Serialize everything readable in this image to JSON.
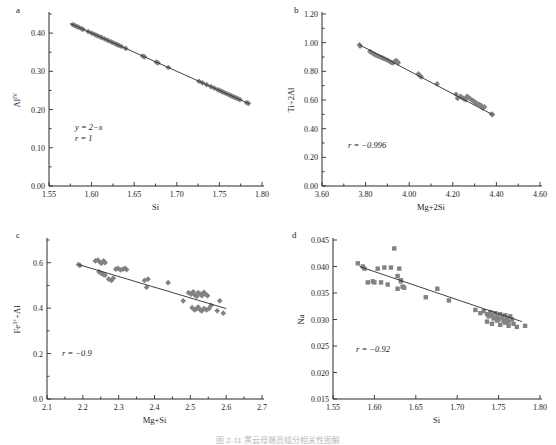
{
  "figure": {
    "caption_partial": "图 2-11  黑云母端员组分相关性图解"
  },
  "chart_data": [
    {
      "type": "scatter",
      "panel": "a",
      "panel_label": "a",
      "title": "",
      "xlabel": "Si",
      "ylabel": "Alᴵᵛ",
      "ylabel_base": "Al",
      "ylabel_sup": "IV",
      "xlim": [
        1.55,
        1.8
      ],
      "ylim": [
        0.0,
        0.45
      ],
      "xticks": [
        "1.55",
        "1.60",
        "1.65",
        "1.70",
        "1.75",
        "1.80"
      ],
      "xtick_values": [
        1.55,
        1.6,
        1.65,
        1.7,
        1.75,
        1.8
      ],
      "yticks": [
        "0.00",
        "0.10",
        "0.20",
        "0.30",
        "0.40"
      ],
      "ytick_values": [
        0.0,
        0.1,
        0.2,
        0.3,
        0.4
      ],
      "minor_ticks": true,
      "grid": false,
      "marker": "diamond",
      "marker_color": "#828282",
      "annotations": [
        "y = 2−x",
        "r = 1"
      ],
      "equation": "y = 2−x",
      "r": "r = 1",
      "fit_line": {
        "x1": 1.575,
        "y1": 0.425,
        "x2": 1.785,
        "y2": 0.215
      },
      "x": [
        1.578,
        1.58,
        1.581,
        1.583,
        1.585,
        1.588,
        1.59,
        1.596,
        1.6,
        1.603,
        1.605,
        1.607,
        1.61,
        1.612,
        1.615,
        1.618,
        1.62,
        1.623,
        1.625,
        1.628,
        1.63,
        1.632,
        1.635,
        1.64,
        1.66,
        1.662,
        1.676,
        1.678,
        1.69,
        1.726,
        1.73,
        1.735,
        1.74,
        1.744,
        1.748,
        1.75,
        1.752,
        1.754,
        1.756,
        1.758,
        1.76,
        1.762,
        1.764,
        1.766,
        1.768,
        1.77,
        1.772,
        1.774,
        1.782,
        1.784
      ],
      "y": [
        0.422,
        0.42,
        0.419,
        0.417,
        0.415,
        0.412,
        0.41,
        0.404,
        0.4,
        0.397,
        0.395,
        0.393,
        0.39,
        0.388,
        0.385,
        0.382,
        0.38,
        0.377,
        0.375,
        0.372,
        0.37,
        0.368,
        0.365,
        0.36,
        0.34,
        0.338,
        0.324,
        0.322,
        0.31,
        0.274,
        0.27,
        0.265,
        0.26,
        0.256,
        0.252,
        0.25,
        0.248,
        0.246,
        0.244,
        0.242,
        0.24,
        0.238,
        0.236,
        0.234,
        0.232,
        0.23,
        0.228,
        0.226,
        0.218,
        0.216
      ]
    },
    {
      "type": "scatter",
      "panel": "b",
      "panel_label": "b",
      "title": "",
      "xlabel": "Mg+2Si",
      "ylabel": "Ti+2Al",
      "xlim": [
        3.6,
        4.6
      ],
      "ylim": [
        0.0,
        1.2
      ],
      "xticks": [
        "3.60",
        "3.80",
        "4.00",
        "4.20",
        "4.40",
        "4.60"
      ],
      "xtick_values": [
        3.6,
        3.8,
        4.0,
        4.2,
        4.4,
        4.6
      ],
      "yticks": [
        "0.00",
        "0.20",
        "0.40",
        "0.60",
        "0.80",
        "1.00",
        "1.20"
      ],
      "ytick_values": [
        0.0,
        0.2,
        0.4,
        0.6,
        0.8,
        1.0,
        1.2
      ],
      "minor_ticks": true,
      "grid": false,
      "marker": "diamond",
      "marker_color": "#828282",
      "annotations": [
        "r = −0.996"
      ],
      "r": "r = −0.996",
      "fit_line": {
        "x1": 3.772,
        "y1": 0.985,
        "x2": 4.382,
        "y2": 0.498
      },
      "x": [
        3.772,
        3.775,
        3.82,
        3.828,
        3.836,
        3.845,
        3.852,
        3.86,
        3.868,
        3.875,
        3.882,
        3.89,
        3.9,
        3.91,
        3.918,
        3.925,
        3.932,
        3.94,
        3.945,
        3.95,
        4.042,
        4.048,
        4.055,
        4.128,
        4.215,
        4.222,
        4.235,
        4.242,
        4.25,
        4.258,
        4.265,
        4.272,
        4.28,
        4.288,
        4.295,
        4.302,
        4.308,
        4.315,
        4.322,
        4.33,
        4.338,
        4.345,
        4.378,
        4.382
      ],
      "y": [
        0.985,
        0.975,
        0.938,
        0.93,
        0.922,
        0.915,
        0.91,
        0.905,
        0.9,
        0.895,
        0.89,
        0.885,
        0.878,
        0.87,
        0.862,
        0.858,
        0.868,
        0.875,
        0.87,
        0.86,
        0.782,
        0.77,
        0.762,
        0.712,
        0.64,
        0.612,
        0.625,
        0.618,
        0.61,
        0.602,
        0.625,
        0.618,
        0.608,
        0.6,
        0.592,
        0.585,
        0.578,
        0.572,
        0.568,
        0.562,
        0.545,
        0.552,
        0.502,
        0.498
      ]
    },
    {
      "type": "scatter",
      "panel": "c",
      "panel_label": "c",
      "title": "",
      "xlabel": "Mg+Si",
      "ylabel": "Fe³⁺+Al",
      "ylabel_base": "Fe",
      "ylabel_sup": "3+",
      "ylabel_tail": "+Al",
      "xlim": [
        2.1,
        2.7
      ],
      "ylim": [
        0.0,
        0.7
      ],
      "xticks": [
        "2.1",
        "2.2",
        "2.3",
        "2.4",
        "2.5",
        "2.6",
        "2.7"
      ],
      "xtick_values": [
        2.1,
        2.2,
        2.3,
        2.4,
        2.5,
        2.6,
        2.7
      ],
      "yticks": [
        "0.0",
        "0.2",
        "0.4",
        "0.6"
      ],
      "ytick_values": [
        0.0,
        0.2,
        0.4,
        0.6
      ],
      "minor_ticks": true,
      "grid": false,
      "marker": "diamond",
      "marker_color": "#828282",
      "annotations": [
        "r = −0.9"
      ],
      "r": "r = −0.9",
      "fit_line": {
        "x1": 2.188,
        "y1": 0.592,
        "x2": 2.6,
        "y2": 0.398
      },
      "x": [
        2.188,
        2.192,
        2.235,
        2.242,
        2.248,
        2.252,
        2.258,
        2.262,
        2.245,
        2.252,
        2.258,
        2.262,
        2.272,
        2.28,
        2.285,
        2.292,
        2.298,
        2.305,
        2.312,
        2.318,
        2.322,
        2.372,
        2.378,
        2.382,
        2.438,
        2.48,
        2.495,
        2.502,
        2.508,
        2.512,
        2.518,
        2.522,
        2.528,
        2.532,
        2.538,
        2.542,
        2.548,
        2.505,
        2.512,
        2.518,
        2.522,
        2.528,
        2.532,
        2.538,
        2.545,
        2.552,
        2.558,
        2.575,
        2.582,
        2.592
      ],
      "y": [
        0.592,
        0.588,
        0.608,
        0.612,
        0.602,
        0.598,
        0.608,
        0.6,
        0.56,
        0.552,
        0.548,
        0.545,
        0.528,
        0.522,
        0.532,
        0.572,
        0.575,
        0.568,
        0.572,
        0.575,
        0.57,
        0.522,
        0.492,
        0.528,
        0.512,
        0.432,
        0.468,
        0.462,
        0.472,
        0.458,
        0.452,
        0.468,
        0.462,
        0.455,
        0.47,
        0.462,
        0.455,
        0.402,
        0.392,
        0.398,
        0.405,
        0.392,
        0.388,
        0.398,
        0.392,
        0.398,
        0.412,
        0.388,
        0.432,
        0.378
      ]
    },
    {
      "type": "scatter",
      "panel": "d",
      "panel_label": "d",
      "title": "",
      "xlabel": "Si",
      "ylabel": "Na",
      "xlim": [
        1.55,
        1.8
      ],
      "ylim": [
        0.015,
        0.045
      ],
      "xticks": [
        "1.55",
        "1.60",
        "1.65",
        "1.70",
        "1.75",
        "1.80"
      ],
      "xtick_values": [
        1.55,
        1.6,
        1.65,
        1.7,
        1.75,
        1.8
      ],
      "yticks": [
        "0.015",
        "0.020",
        "0.025",
        "0.030",
        "0.035",
        "0.040",
        "0.045"
      ],
      "ytick_values": [
        0.015,
        0.02,
        0.025,
        0.03,
        0.035,
        0.04,
        0.045
      ],
      "minor_ticks": false,
      "grid": false,
      "marker": "square",
      "marker_color": "#828282",
      "annotations": [
        "r = −0.92"
      ],
      "r": "r = −0.92",
      "fit_line": {
        "x1": 1.582,
        "y1": 0.04,
        "x2": 1.778,
        "y2": 0.0296
      },
      "x": [
        1.58,
        1.586,
        1.588,
        1.592,
        1.598,
        1.6,
        1.604,
        1.608,
        1.612,
        1.616,
        1.62,
        1.624,
        1.628,
        1.63,
        1.632,
        1.634,
        1.636,
        1.628,
        1.632,
        1.662,
        1.676,
        1.69,
        1.722,
        1.728,
        1.732,
        1.736,
        1.738,
        1.74,
        1.742,
        1.744,
        1.746,
        1.748,
        1.75,
        1.752,
        1.754,
        1.756,
        1.758,
        1.76,
        1.762,
        1.764,
        1.766,
        1.736,
        1.742,
        1.748,
        1.752,
        1.758,
        1.762,
        1.768,
        1.772,
        1.782
      ],
      "y": [
        0.0406,
        0.04,
        0.0396,
        0.037,
        0.0372,
        0.037,
        0.0396,
        0.037,
        0.0398,
        0.0366,
        0.0398,
        0.0434,
        0.0382,
        0.0396,
        0.0374,
        0.0362,
        0.036,
        0.0358,
        0.0372,
        0.0342,
        0.0358,
        0.0336,
        0.0318,
        0.0312,
        0.0316,
        0.031,
        0.0306,
        0.0314,
        0.0308,
        0.0302,
        0.0312,
        0.0306,
        0.03,
        0.031,
        0.0304,
        0.0298,
        0.0308,
        0.0302,
        0.0296,
        0.0306,
        0.03,
        0.0296,
        0.0292,
        0.0298,
        0.029,
        0.0294,
        0.0288,
        0.0292,
        0.0286,
        0.0288
      ]
    }
  ]
}
